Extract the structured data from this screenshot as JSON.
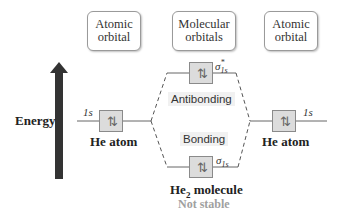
{
  "headers": {
    "left": "Atomic orbital",
    "left_lines": [
      "Atomic",
      "orbital"
    ],
    "center_lines": [
      "Molecular",
      "orbitals"
    ],
    "right_lines": [
      "Atomic",
      "orbital"
    ]
  },
  "axis": {
    "label": "Energy",
    "arrow_color": "#333333"
  },
  "left_atom": {
    "orbital": "1s",
    "electrons": "⇅",
    "name": "He atom"
  },
  "right_atom": {
    "orbital": "1s",
    "electrons": "⇅",
    "name": "He atom"
  },
  "antibonding": {
    "label": "Antibonding",
    "orbital_symbol": "σ",
    "orbital_sup": "*",
    "orbital_sub": "1s",
    "electrons": "⇅"
  },
  "bonding": {
    "label": "Bonding",
    "orbital_symbol": "σ",
    "orbital_sub": "1s",
    "electrons": "⇅"
  },
  "molecule": {
    "name_prefix": "He",
    "name_sub": "2",
    "name_suffix": " molecule",
    "stability": "Not stable"
  },
  "colors": {
    "orbital_fill": "#dcdcdc",
    "band_fill": "#f1f1f1",
    "dash": "#555555",
    "muted_text": "#a0a0a0"
  }
}
